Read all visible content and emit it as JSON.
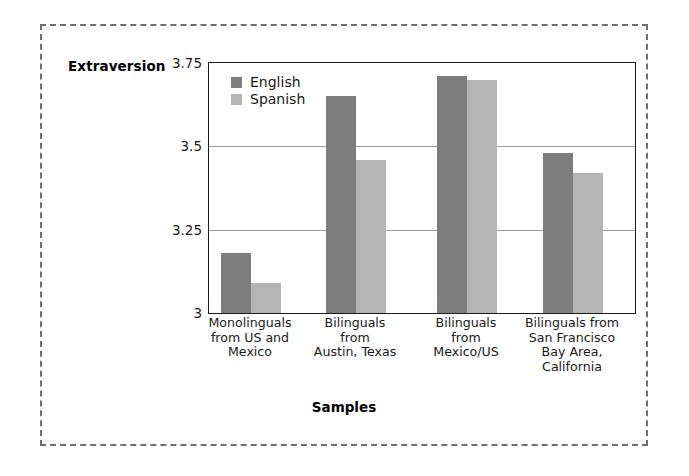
{
  "chart_data": {
    "type": "bar",
    "title": "",
    "xlabel": "Samples",
    "ylabel": "Extraversion",
    "ylim": [
      3,
      3.75
    ],
    "yticks": [
      "3",
      "3.25",
      "3.5",
      "3.75"
    ],
    "ytick_values": [
      3,
      3.25,
      3.5,
      3.75
    ],
    "grid": "horizontal",
    "legend_position": "top-left-inside",
    "categories": [
      "Monolinguals from US and Mexico",
      "Bilinguals from Austin, Texas",
      "Bilinguals from Mexico/US",
      "Bilinguals from San Francisco Bay Area, California"
    ],
    "category_label_lines": [
      [
        "Monolinguals",
        "from US and",
        "Mexico"
      ],
      [
        "Bilinguals",
        "from",
        "Austin, Texas"
      ],
      [
        "Bilinguals",
        "from",
        "Mexico/US"
      ],
      [
        "Bilinguals from",
        "San Francisco",
        "Bay Area,",
        "California"
      ]
    ],
    "series": [
      {
        "name": "English",
        "color": "#7d7d7d",
        "values": [
          3.18,
          3.65,
          3.71,
          3.48
        ]
      },
      {
        "name": "Spanish",
        "color": "#b4b4b4",
        "values": [
          3.09,
          3.46,
          3.7,
          3.42
        ]
      }
    ]
  },
  "legend": {
    "items": [
      {
        "label": "English"
      },
      {
        "label": "Spanish"
      }
    ]
  },
  "axes": {
    "y_title": "Extraversion",
    "x_title": "Samples",
    "y_tick_0": "3",
    "y_tick_1": "3.25",
    "y_tick_2": "3.5",
    "y_tick_3": "3.75"
  },
  "colors": {
    "english_bar": "#7d7d7d",
    "spanish_bar": "#b4b4b4",
    "gridline": "#9a9a9a",
    "plot_border": "#1a1a1a",
    "figure_border": "#6f6f6f"
  }
}
